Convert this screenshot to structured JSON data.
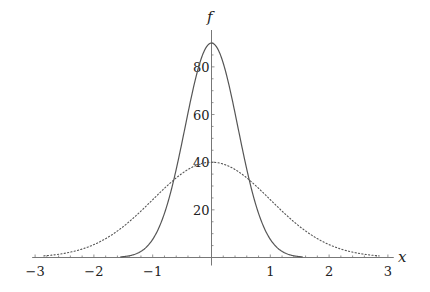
{
  "chart_data": {
    "type": "line",
    "title": "",
    "xlabel": "x",
    "ylabel": "f",
    "xlim": [
      -3,
      3
    ],
    "ylim": [
      0,
      95
    ],
    "grid": false,
    "legend": null,
    "x_ticks": [
      -3,
      -2,
      -1,
      1,
      2,
      3
    ],
    "y_ticks": [
      20,
      40,
      60,
      80
    ],
    "x_tick_labels": [
      "−3",
      "−2",
      "−1",
      "1",
      "2",
      "3"
    ],
    "y_tick_labels": [
      "20",
      "40",
      "60",
      "80"
    ],
    "series": [
      {
        "name": "solid-narrow-peak",
        "style": "solid",
        "color": "#555555",
        "description": "Narrow bell curve, peak ~90 at x=0, near zero beyond |x|~1.5",
        "x": [
          -1.5,
          -1.25,
          -1.0,
          -0.75,
          -0.5,
          -0.25,
          0.0,
          0.25,
          0.5,
          0.75,
          1.0,
          1.25,
          1.5
        ],
        "values": [
          0.4,
          1.9,
          7.6,
          22.6,
          48.9,
          77.0,
          90.0,
          77.0,
          48.9,
          22.6,
          7.6,
          1.9,
          0.4
        ]
      },
      {
        "name": "dotted-wide-peak",
        "style": "dotted",
        "color": "#555555",
        "description": "Wide bell curve, peak ~40 at x=0, near zero beyond |x|~2.7",
        "x": [
          -3.0,
          -2.5,
          -2.0,
          -1.5,
          -1.0,
          -0.5,
          0.0,
          0.5,
          1.0,
          1.5,
          2.0,
          2.5,
          3.0
        ],
        "values": [
          0.4,
          1.8,
          5.4,
          13.0,
          24.3,
          35.3,
          40.0,
          35.3,
          24.3,
          13.0,
          5.4,
          1.8,
          0.4
        ]
      }
    ]
  },
  "axes": {
    "x_label": "x",
    "y_label": "f"
  }
}
